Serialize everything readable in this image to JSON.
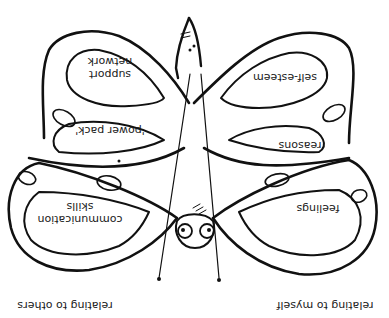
{
  "diagram": {
    "type": "butterfly-worksheet",
    "orientation": "rotated-180",
    "ink_color": "#111111",
    "background": "#ffffff",
    "wings": {
      "left_upper_section": [
        "support",
        "network"
      ],
      "left_middle_section": "'power pack'",
      "left_lower_section": [
        "communication",
        "skills"
      ],
      "right_upper_section": "self-esteem",
      "right_middle_section": "reasons",
      "right_lower_section": "feelings"
    },
    "captions": {
      "left": "relating to others",
      "right": "relating to myself"
    }
  }
}
